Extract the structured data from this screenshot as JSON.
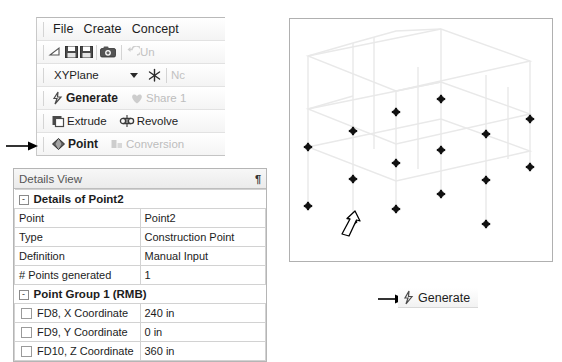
{
  "toolbar": {
    "menu": [
      {
        "label": "File",
        "name": "menu-file"
      },
      {
        "label": "Create",
        "name": "menu-create"
      },
      {
        "label": "Concept",
        "name": "menu-concept"
      }
    ],
    "quick_icons": [
      {
        "name": "new-sketch-icon",
        "glyph": "new"
      },
      {
        "name": "save-icon",
        "glyph": "save"
      },
      {
        "name": "save-as-icon",
        "glyph": "save"
      },
      {
        "name": "screenshot-camera-icon",
        "glyph": "camera"
      }
    ],
    "undo_label": "Un",
    "plane_select": {
      "value": "XYPlane",
      "new_plane_label": "Nc"
    },
    "generate_label": "Generate",
    "share_label": "Share 1",
    "extrude_label": "Extrude",
    "revolve_label": "Revolve",
    "point_label": "Point",
    "conversion_label": "Conversion"
  },
  "details_view": {
    "title": "Details View",
    "pin_glyph": "¶",
    "sections": [
      {
        "name": "details-of-point2",
        "header": "Details of Point2",
        "rows": [
          {
            "label": "Point",
            "value": "Point2",
            "checkbox": false
          },
          {
            "label": "Type",
            "value": "Construction Point",
            "checkbox": false
          },
          {
            "label": "Definition",
            "value": "Manual Input",
            "checkbox": false
          },
          {
            "label": "# Points generated",
            "value": "1",
            "checkbox": false
          }
        ]
      },
      {
        "name": "point-group-1",
        "header": "Point Group 1  (RMB)",
        "rows": [
          {
            "label": "FD8, X Coordinate",
            "value": "240 in",
            "checkbox": true
          },
          {
            "label": "FD9, Y Coordinate",
            "value": "0 in",
            "checkbox": true
          },
          {
            "label": "FD10, Z Coordinate",
            "value": "360 in",
            "checkbox": true
          }
        ]
      }
    ]
  },
  "viewport": {
    "name": "3d-model-viewport",
    "wireframe_color": "#e8e8e8",
    "point_color": "#111111",
    "points": [
      {
        "x": 18,
        "y": 128
      },
      {
        "x": 18,
        "y": 187
      },
      {
        "x": 63,
        "y": 112
      },
      {
        "x": 63,
        "y": 160
      },
      {
        "x": 63,
        "y": 203
      },
      {
        "x": 106,
        "y": 93
      },
      {
        "x": 106,
        "y": 144
      },
      {
        "x": 106,
        "y": 190
      },
      {
        "x": 151,
        "y": 80
      },
      {
        "x": 151,
        "y": 131
      },
      {
        "x": 151,
        "y": 175
      },
      {
        "x": 196,
        "y": 115
      },
      {
        "x": 196,
        "y": 161
      },
      {
        "x": 196,
        "y": 205
      },
      {
        "x": 240,
        "y": 100
      },
      {
        "x": 240,
        "y": 148
      }
    ],
    "highlight_arrow": {
      "name": "selected-point-callout-arrow"
    }
  },
  "callouts": {
    "toolbar_arrow": {
      "name": "point-tool-callout-arrow"
    },
    "generate_arrow": {
      "name": "generate-button-callout-arrow"
    },
    "generate_button_label": "Generate"
  }
}
